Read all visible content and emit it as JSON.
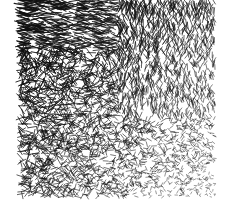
{
  "image": {
    "description": "Abstract texture of short black line strokes on white; strokes are longer and denser at top-left, shorter and finer toward bottom-right",
    "background": "#ffffff",
    "stroke_color": "#111111",
    "region": {
      "x0": 20,
      "y0": 0,
      "x1": 215,
      "y1": 197
    }
  }
}
